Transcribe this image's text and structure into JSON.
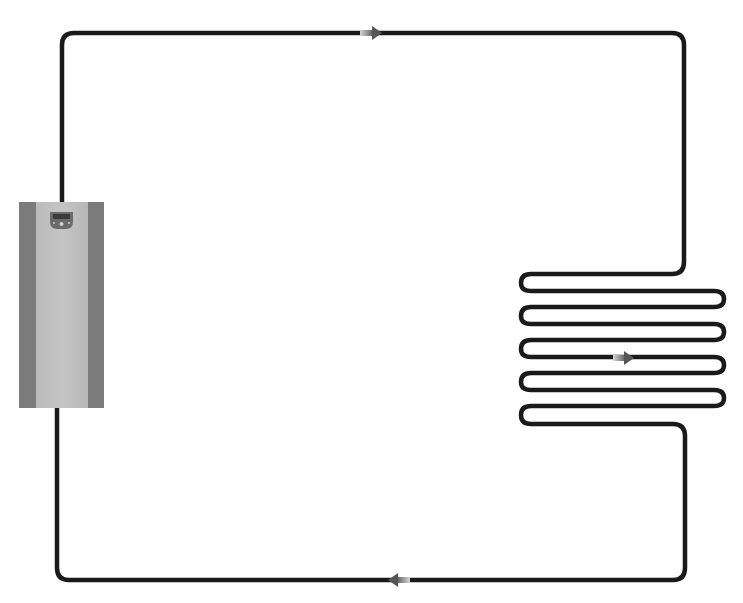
{
  "diagram": {
    "colors": {
      "pipe": "#1a1a1a",
      "background": "#ffffff",
      "boiler_side": "#7d7d7d",
      "boiler_center": "#bdbdbd",
      "boiler_panel": "#6a6a6a",
      "arrow_dark": "#5a5a5a",
      "arrow_light": "#c8c8c8"
    },
    "components": [
      {
        "id": "boiler",
        "label": "boiler unit",
        "x": 19,
        "y": 202,
        "w": 85,
        "h": 206
      },
      {
        "id": "coil",
        "label": "serpentine heating coil",
        "rows": 5
      }
    ],
    "flow_arrows": [
      {
        "id": "top",
        "direction": "right",
        "x": 372,
        "y": 33
      },
      {
        "id": "coil",
        "direction": "right",
        "x": 624,
        "y": 358
      },
      {
        "id": "bottom",
        "direction": "left",
        "x": 398,
        "y": 580
      }
    ]
  }
}
